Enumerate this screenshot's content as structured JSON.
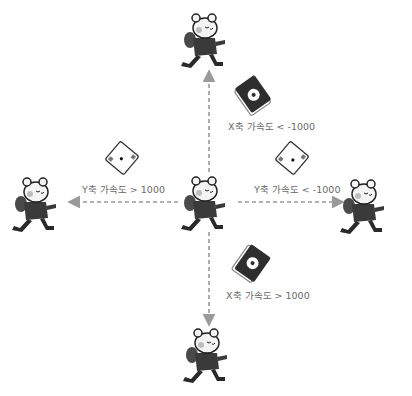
{
  "diagram": {
    "type": "accelerometer-direction-diagram",
    "center_character": {
      "x": 209,
      "y": 205
    },
    "characters": [
      {
        "id": "top",
        "x": 209,
        "y": 42,
        "facing": "right"
      },
      {
        "id": "left",
        "x": 38,
        "y": 205,
        "facing": "right"
      },
      {
        "id": "right",
        "x": 363,
        "y": 205,
        "facing": "right"
      },
      {
        "id": "bottom",
        "x": 209,
        "y": 345,
        "facing": "right"
      }
    ],
    "arrows": [
      {
        "direction": "up",
        "from": "center",
        "to": "top"
      },
      {
        "direction": "left",
        "from": "center",
        "to": "left"
      },
      {
        "direction": "right",
        "from": "center",
        "to": "right"
      },
      {
        "direction": "down",
        "from": "center",
        "to": "bottom"
      }
    ],
    "conditions": [
      {
        "id": "up",
        "label": "X축 가속도 < -1000",
        "device": "dark-tilted-up"
      },
      {
        "id": "left",
        "label": "Y축 가속도 > 1000",
        "device": "light-tilted-left"
      },
      {
        "id": "right",
        "label": "Y축 가속도 < -1000",
        "device": "light-tilted-right"
      },
      {
        "id": "down",
        "label": "X축 가속도 > 1000",
        "device": "dark-tilted-down"
      }
    ],
    "colors": {
      "arrow": "#9a9a9a",
      "text": "#6a6a6a",
      "character_body": "#3a3a3a",
      "character_face": "#f4f4f4"
    }
  }
}
